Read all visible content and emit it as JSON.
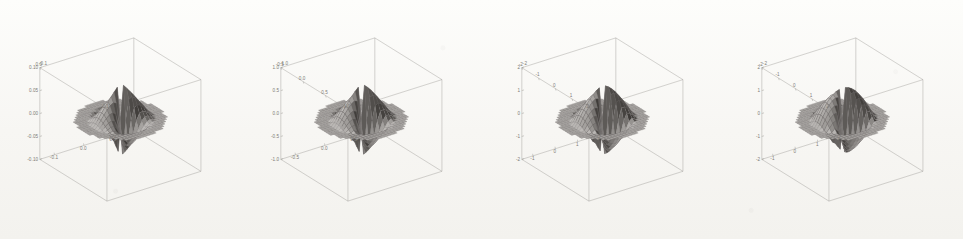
{
  "figure": {
    "type": "multi-panel-3d-surface-plot",
    "panel_count": 4,
    "background_color": "#fbfaf8",
    "render_style": "scanned-grayscale-wireframe-surface",
    "mesh_color": "#6e6b67",
    "surface_light_color": "#cdcac6",
    "surface_dark_color": "#4a4743",
    "axis_color": "#8d8a86",
    "tick_label_color": "#7d7a76"
  },
  "chart_data": [
    {
      "type": "surface",
      "panel_index": 0,
      "title": "",
      "xlabel": "",
      "ylabel": "",
      "zlabel": "",
      "grid": false,
      "legend": "none",
      "xlim": [
        -0.15,
        0.15
      ],
      "ylim": [
        -0.15,
        0.15
      ],
      "zlim": [
        -0.12,
        0.12
      ],
      "x_ticks": [
        "-0.1",
        "0.0",
        "0.1"
      ],
      "y_ticks": [
        "0.0",
        "0.1"
      ],
      "z_ticks": [
        "0.10",
        "0.05",
        "0.00",
        "-0.05",
        "-0.10"
      ],
      "z_top_corner_label": "-0.1",
      "description": "Smooth rounded dome-saddle surface, small amplitude",
      "shape": "smooth-dome-saddle",
      "spike_sharpness": 0.15,
      "amplitude": 0.1
    },
    {
      "type": "surface",
      "panel_index": 1,
      "title": "",
      "xlabel": "",
      "ylabel": "",
      "zlabel": "",
      "grid": false,
      "legend": "none",
      "xlim": [
        -0.9,
        0.9
      ],
      "ylim": [
        -0.9,
        0.9
      ],
      "zlim": [
        -1.2,
        1.2
      ],
      "x_ticks": [
        "-0.5",
        "0.0",
        "0.5"
      ],
      "y_ticks": [
        "-0.5",
        "0.0",
        "0.5",
        "1.0"
      ],
      "z_ticks": [
        "1.0",
        "0.5",
        "0.0",
        "-0.5",
        "-1.0"
      ],
      "z_top_corner_label": "-1.0",
      "description": "Rounded dome-saddle surface with slightly drawn corners",
      "shape": "rounded-saddle",
      "spike_sharpness": 0.3,
      "amplitude": 1.0
    },
    {
      "type": "surface",
      "panel_index": 2,
      "title": "",
      "xlabel": "",
      "ylabel": "",
      "zlabel": "",
      "grid": false,
      "legend": "none",
      "xlim": [
        -2.4,
        2.4
      ],
      "ylim": [
        -2.4,
        2.4
      ],
      "zlim": [
        -2.4,
        2.4
      ],
      "x_ticks": [
        "-1",
        "0",
        "1",
        "2"
      ],
      "y_ticks": [
        "-2",
        "-1",
        "0",
        "1",
        "2"
      ],
      "z_ticks": [
        "2",
        "1",
        "0",
        "-1",
        "-2"
      ],
      "z_top_corner_label": "-2",
      "description": "Four-lobed saddle surface, lobes pulled into blunt points",
      "shape": "four-lobed-saddle",
      "spike_sharpness": 0.6,
      "amplitude": 2.0
    },
    {
      "type": "surface",
      "panel_index": 3,
      "title": "",
      "xlabel": "",
      "ylabel": "",
      "zlabel": "",
      "grid": false,
      "legend": "none",
      "xlim": [
        -2.4,
        2.4
      ],
      "ylim": [
        -2.4,
        2.4
      ],
      "zlim": [
        -2.4,
        2.4
      ],
      "x_ticks": [
        "-1",
        "0",
        "1",
        "2"
      ],
      "y_ticks": [
        "-2",
        "-1",
        "0",
        "1",
        "2"
      ],
      "z_ticks": [
        "2",
        "1",
        "0",
        "-1",
        "-2"
      ],
      "z_top_corner_label": "-2",
      "description": "Sharp four-pointed star surface with thin concave spikes",
      "shape": "sharp-star",
      "spike_sharpness": 1.0,
      "amplitude": 2.0
    }
  ],
  "panels": [
    {
      "name": "panel-1",
      "z_ticks": [
        "0.10",
        "0.05",
        "0.00",
        "-0.05",
        "-0.10"
      ],
      "z_corner": "-0.1",
      "y_ticks": [
        "0.0",
        "0.1"
      ],
      "x_ticks": [
        "-0.1",
        "0.0",
        "0.1"
      ]
    },
    {
      "name": "panel-2",
      "z_ticks": [
        "1.0",
        "0.5",
        "0.0",
        "-0.5",
        "-1.0"
      ],
      "z_corner": "-1.0",
      "y_ticks": [
        "-0.5",
        "0.0",
        "0.5",
        "1.0"
      ],
      "x_ticks": [
        "-0.5",
        "0.0",
        "0.5"
      ]
    },
    {
      "name": "panel-3",
      "z_ticks": [
        "2",
        "1",
        "0",
        "-1",
        "-2"
      ],
      "z_corner": "-2",
      "y_ticks": [
        "-2",
        "-1",
        "0",
        "1",
        "2"
      ],
      "x_ticks": [
        "-1",
        "0",
        "1",
        "2"
      ]
    },
    {
      "name": "panel-4",
      "z_ticks": [
        "2",
        "1",
        "0",
        "-1",
        "-2"
      ],
      "z_corner": "-2",
      "y_ticks": [
        "-2",
        "-1",
        "0",
        "1",
        "2"
      ],
      "x_ticks": [
        "-1",
        "0",
        "1",
        "2"
      ]
    }
  ]
}
